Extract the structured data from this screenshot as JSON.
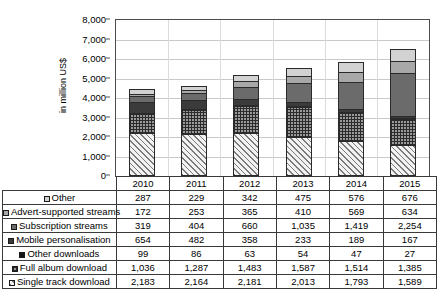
{
  "chart_data": {
    "type": "bar",
    "stacked": true,
    "title": "",
    "xlabel": "",
    "ylabel": "in million US$",
    "ylim": [
      0,
      8000
    ],
    "ytick_step": 1000,
    "ytick_labels": [
      "0",
      "1,000",
      "2,000",
      "3,000",
      "4,000",
      "5,000",
      "6,000",
      "7,000",
      "8,000"
    ],
    "grid": true,
    "legend_position": "table-below",
    "categories": [
      "2010",
      "2011",
      "2012",
      "2013",
      "2014",
      "2015"
    ],
    "series": [
      {
        "name": "Single track download",
        "swatch": "diagonal-hatch",
        "values": [
          2183,
          2164,
          2181,
          2013,
          1793,
          1589
        ],
        "display": [
          "2,183",
          "2,164",
          "2,181",
          "2,013",
          "1,793",
          "1,589"
        ]
      },
      {
        "name": "Full album download",
        "swatch": "checkered",
        "values": [
          1036,
          1287,
          1483,
          1587,
          1514,
          1385
        ],
        "display": [
          "1,036",
          "1,287",
          "1,483",
          "1,587",
          "1,514",
          "1,385"
        ]
      },
      {
        "name": "Other downloads",
        "swatch": "black",
        "values": [
          99,
          86,
          63,
          54,
          47,
          27
        ],
        "display": [
          "99",
          "86",
          "63",
          "54",
          "47",
          "27"
        ]
      },
      {
        "name": "Mobile personalisation",
        "swatch": "dark-gray",
        "values": [
          654,
          482,
          358,
          233,
          189,
          167
        ],
        "display": [
          "654",
          "482",
          "358",
          "233",
          "189",
          "167"
        ]
      },
      {
        "name": "Subscription streams",
        "swatch": "mid-gray",
        "values": [
          319,
          404,
          660,
          1035,
          1419,
          2254
        ],
        "display": [
          "319",
          "404",
          "660",
          "1,035",
          "1,419",
          "2,254"
        ]
      },
      {
        "name": "Advert-supported streams",
        "swatch": "light-gray",
        "values": [
          172,
          253,
          365,
          410,
          569,
          634
        ],
        "display": [
          "172",
          "253",
          "365",
          "410",
          "569",
          "634"
        ]
      },
      {
        "name": "Other",
        "swatch": "very-light-gray",
        "values": [
          287,
          229,
          342,
          475,
          576,
          676
        ],
        "display": [
          "287",
          "229",
          "342",
          "475",
          "576",
          "676"
        ]
      }
    ],
    "totals": [
      4750,
      4905,
      5472,
      5807,
      6107,
      6732
    ]
  },
  "table": {
    "years": [
      "2010",
      "2011",
      "2012",
      "2013",
      "2014",
      "2015"
    ],
    "rows": [
      {
        "label": "Other",
        "values": [
          "287",
          "229",
          "342",
          "475",
          "576",
          "676"
        ]
      },
      {
        "label": "Advert-supported streams",
        "values": [
          "172",
          "253",
          "365",
          "410",
          "569",
          "634"
        ]
      },
      {
        "label": "Subscription streams",
        "values": [
          "319",
          "404",
          "660",
          "1,035",
          "1,419",
          "2,254"
        ]
      },
      {
        "label": "Mobile personalisation",
        "values": [
          "654",
          "482",
          "358",
          "233",
          "189",
          "167"
        ]
      },
      {
        "label": "Other downloads",
        "values": [
          "99",
          "86",
          "63",
          "54",
          "47",
          "27"
        ]
      },
      {
        "label": "Full album download",
        "values": [
          "1,036",
          "1,287",
          "1,483",
          "1,587",
          "1,514",
          "1,385"
        ]
      },
      {
        "label": "Single track download",
        "values": [
          "2,183",
          "2,164",
          "2,181",
          "2,013",
          "1,793",
          "1,589"
        ]
      }
    ]
  },
  "colors": {
    "other": "#d2d2d2",
    "advert_supported_streams": "#a8a8a8",
    "subscription_streams": "#6b6b6b",
    "mobile_personalisation": "#3b3b3b",
    "other_downloads": "#141414",
    "full_album_download": "#9a9a9a",
    "single_track_download": "#f2f2f2",
    "gridline": "#c9c9c9",
    "axis": "#4c4c4c"
  }
}
